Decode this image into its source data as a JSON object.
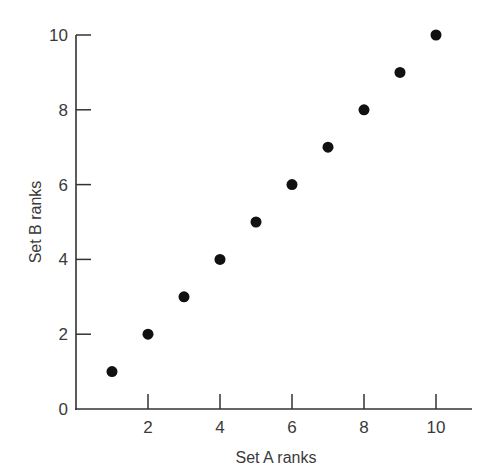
{
  "chart_data": {
    "type": "scatter",
    "title": "",
    "xlabel": "Set A ranks",
    "ylabel": "Set B ranks",
    "xlim": [
      0,
      11
    ],
    "ylim": [
      0,
      10
    ],
    "xticks": [
      2,
      4,
      6,
      8,
      10
    ],
    "yticks": [
      0,
      2,
      4,
      6,
      8,
      10
    ],
    "grid": false,
    "legend": null,
    "series": [
      {
        "name": "Ranks",
        "marker": "filled-circle",
        "color": "#111111",
        "x": [
          1,
          2,
          3,
          4,
          5,
          6,
          7,
          8,
          9,
          10
        ],
        "y": [
          1,
          2,
          3,
          4,
          5,
          6,
          7,
          8,
          9,
          10
        ]
      }
    ]
  },
  "labels": {
    "xlabel": "Set A ranks",
    "ylabel": "Set B ranks",
    "origin": "0"
  }
}
